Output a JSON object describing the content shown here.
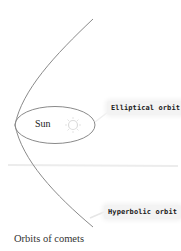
{
  "diagram": {
    "caption": "Orbits of comets",
    "central_body": {
      "label": "Sun",
      "icon": "sun-icon"
    },
    "orbits": [
      {
        "id": "elliptical",
        "label": "Elliptical orbit"
      },
      {
        "id": "hyperbolic",
        "label": "Hyperbolic orbit"
      }
    ],
    "colors": {
      "orbit_line": "#8a8a8a",
      "label_bg": "#f3f3f3",
      "sun_glyph": "#dcdcdc",
      "divider": "#ececec"
    }
  }
}
